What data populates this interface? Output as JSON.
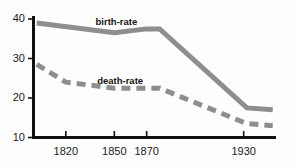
{
  "chart_data": {
    "type": "line",
    "title": "",
    "subtitle": "",
    "xlabel": "",
    "ylabel": "",
    "xlim": [
      1800,
      1950
    ],
    "ylim": [
      10,
      40
    ],
    "grid": false,
    "legend_position": "inline-annotations",
    "x_tick_labels": [
      "1820",
      "1850",
      "1870",
      "1930"
    ],
    "x_ticks": [
      1820,
      1850,
      1870,
      1930
    ],
    "y_tick_labels": [
      "40",
      "30",
      "20",
      "10"
    ],
    "y_ticks": [
      40,
      30,
      20,
      10
    ],
    "series": [
      {
        "name": "birth-rate",
        "style": "solid",
        "color": "#8e8e8e",
        "x": [
          1802,
          1850,
          1870,
          1878,
          1932,
          1948
        ],
        "values": [
          39,
          36.5,
          37.5,
          37.5,
          17.5,
          17
        ]
      },
      {
        "name": "death-rate",
        "style": "dashed",
        "color": "#8e8e8e",
        "x": [
          1802,
          1820,
          1850,
          1878,
          1932,
          1948
        ],
        "values": [
          28.5,
          24,
          22.5,
          22.5,
          13.5,
          13
        ]
      }
    ],
    "annotations": [
      {
        "text": "birth-rate",
        "x": 1852,
        "y": 39.2
      },
      {
        "text": "death-rate",
        "x": 1853,
        "y": 24.3
      }
    ]
  },
  "axis": {
    "line_color": "#111111",
    "y_labels": [
      {
        "text": "40",
        "value": 40
      },
      {
        "text": "30",
        "value": 30
      },
      {
        "text": "20",
        "value": 20
      },
      {
        "text": "10",
        "value": 10
      }
    ],
    "x_labels": [
      {
        "text": "1820",
        "value": 1820
      },
      {
        "text": "1850",
        "value": 1850
      },
      {
        "text": "1870",
        "value": 1870
      },
      {
        "text": "1930",
        "value": 1930
      }
    ]
  }
}
